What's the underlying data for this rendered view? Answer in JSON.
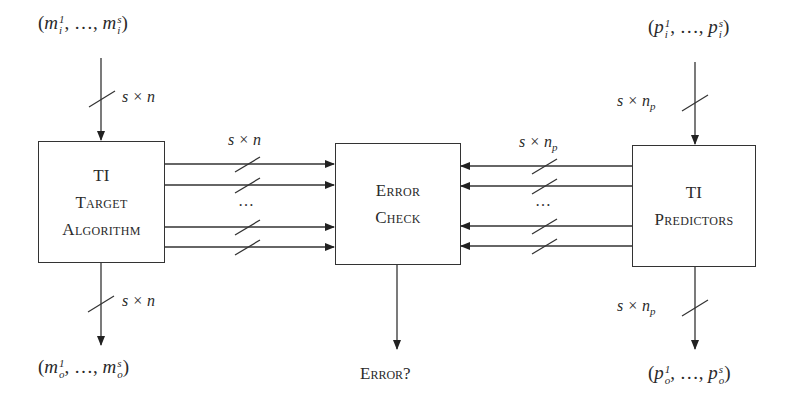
{
  "diagram": {
    "boxes": {
      "target": {
        "line1": "TI",
        "line2": "Target",
        "line3": "Algorithm"
      },
      "check": {
        "line1": "Error",
        "line2": "Check"
      },
      "predictors": {
        "line1": "TI",
        "line2": "Predictors"
      }
    },
    "inputs": {
      "target": {
        "base": "m",
        "sub": "i",
        "sup_first": "1",
        "sup_last": "s",
        "ellipsis": "…"
      },
      "predictors": {
        "base": "p",
        "sub": "i",
        "sup_first": "1",
        "sup_last": "s",
        "ellipsis": "…"
      }
    },
    "outputs": {
      "target": {
        "base": "m",
        "sub": "o",
        "sup_first": "1",
        "sup_last": "s",
        "ellipsis": "…"
      },
      "predictors": {
        "base": "p",
        "sub": "o",
        "sup_first": "1",
        "sup_last": "s",
        "ellipsis": "…"
      },
      "check": "Error?"
    },
    "bus_labels": {
      "target_in": "s × n",
      "target_out": "s × n",
      "target_to_check": "s × n",
      "predictors_in": "s × n",
      "predictors_in_sub": "p",
      "predictors_out": "s × n",
      "predictors_out_sub": "p",
      "predictors_to_check": "s × n",
      "predictors_to_check_sub": "p"
    },
    "ellipsis_left": "…",
    "ellipsis_right": "…"
  }
}
